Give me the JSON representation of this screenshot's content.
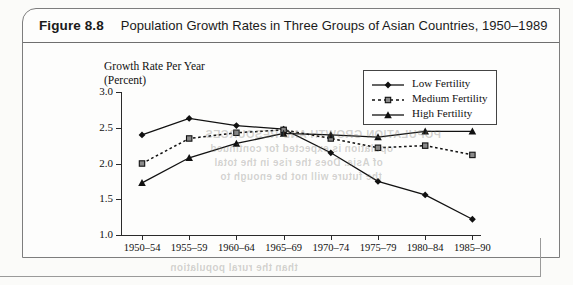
{
  "figure": {
    "number": "Figure 8.8",
    "title": "Population Growth Rates in Three Groups of Asian Countries, 1950–1989"
  },
  "legend": {
    "position": "top-right",
    "entries": [
      {
        "label": "Low Fertility",
        "marker": "diamond",
        "line": "solid",
        "color": "#111111"
      },
      {
        "label": "Medium Fertility",
        "marker": "square",
        "line": "dashed",
        "color": "#111111"
      },
      {
        "label": "High Fertility",
        "marker": "triangle",
        "line": "solid",
        "color": "#111111"
      }
    ]
  },
  "bleed_text": [
    {
      "text": "POPULATION GROWTH AND RESOURCES",
      "x": 205,
      "y": 128,
      "size": 11
    },
    {
      "text": "opulation is expected for continued",
      "x": 210,
      "y": 143,
      "size": 10
    },
    {
      "text": "of Asia. Does the rise in the total",
      "x": 214,
      "y": 157,
      "size": 10
    },
    {
      "text": "the future will not be enough to",
      "x": 220,
      "y": 171,
      "size": 10
    },
    {
      "text": "than the rural population",
      "x": 170,
      "y": 262,
      "size": 10
    }
  ],
  "chart_data": {
    "type": "line",
    "title": "Population Growth Rates in Three Groups of Asian Countries, 1950–1989",
    "xlabel": "",
    "ylabel": "Growth Rate Per Year (Percent)",
    "categories": [
      "1950–54",
      "1955–59",
      "1960–64",
      "1965–69",
      "1970–74",
      "1975–79",
      "1980–84",
      "1985–90"
    ],
    "ylim": [
      1.0,
      3.0
    ],
    "yticks": [
      "1.0",
      "1.5",
      "2.0",
      "2.5",
      "3.0"
    ],
    "ytick_values": [
      1.0,
      1.5,
      2.0,
      2.5,
      3.0
    ],
    "grid": false,
    "legend_position": "top-right",
    "series": [
      {
        "name": "Low Fertility",
        "values": [
          2.4,
          2.63,
          2.53,
          2.48,
          2.15,
          1.75,
          1.56,
          1.22
        ]
      },
      {
        "name": "Medium Fertility",
        "values": [
          2.0,
          2.35,
          2.43,
          2.47,
          2.35,
          2.22,
          2.25,
          2.12
        ]
      },
      {
        "name": "High Fertility",
        "values": [
          1.73,
          2.08,
          2.28,
          2.42,
          2.4,
          2.37,
          2.45,
          2.45
        ]
      }
    ]
  }
}
